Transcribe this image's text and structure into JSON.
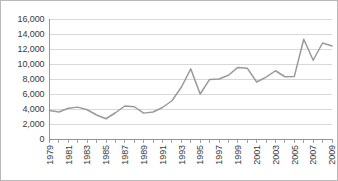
{
  "chart_data": {
    "type": "line",
    "title": "",
    "subtitle": "",
    "xlabel": "",
    "ylabel": "",
    "x": [
      1979,
      1980,
      1981,
      1982,
      1983,
      1984,
      1985,
      1986,
      1987,
      1988,
      1989,
      1990,
      1991,
      1992,
      1993,
      1994,
      1995,
      1996,
      1997,
      1998,
      1999,
      2000,
      2001,
      2002,
      2003,
      2004,
      2005,
      2006,
      2007,
      2008,
      2009
    ],
    "values": [
      3800,
      3600,
      4100,
      4250,
      3900,
      3200,
      2700,
      3500,
      4400,
      4300,
      3450,
      3600,
      4200,
      5100,
      6900,
      9350,
      6000,
      7950,
      8000,
      8500,
      9550,
      9450,
      7600,
      8250,
      9100,
      8300,
      8350,
      13300,
      10500,
      12800,
      12400
    ],
    "series": [
      {
        "name": "series-1",
        "color": "#9a9a9a",
        "values": [
          3800,
          3600,
          4100,
          4250,
          3900,
          3200,
          2700,
          3500,
          4400,
          4300,
          3450,
          3600,
          4200,
          5100,
          6900,
          9350,
          6000,
          7950,
          8000,
          8500,
          9550,
          9450,
          7600,
          8250,
          9100,
          8300,
          8350,
          13300,
          10500,
          12800,
          12400
        ]
      }
    ],
    "ylim": [
      0,
      16000
    ],
    "ytick_values": [
      0,
      2000,
      4000,
      6000,
      8000,
      10000,
      12000,
      14000,
      16000
    ],
    "ytick_labels": [
      "0",
      "2,000",
      "4,000",
      "6,000",
      "8,000",
      "10,000",
      "12,000",
      "14,000",
      "16,000"
    ],
    "xlim": [
      1979,
      2009
    ],
    "xtick_values": [
      1979,
      1980,
      1981,
      1982,
      1983,
      1984,
      1985,
      1986,
      1987,
      1988,
      1989,
      1990,
      1991,
      1992,
      1993,
      1994,
      1995,
      1996,
      1997,
      1998,
      1999,
      2000,
      2001,
      2002,
      2003,
      2004,
      2005,
      2006,
      2007,
      2008,
      2009
    ],
    "xtick_labels": [
      "1979",
      "",
      "1981",
      "",
      "1983",
      "",
      "1985",
      "",
      "1987",
      "",
      "1989",
      "",
      "1991",
      "",
      "1993",
      "",
      "1995",
      "",
      "1997",
      "",
      "1999",
      "",
      "2001",
      "",
      "2003",
      "",
      "2005",
      "",
      "2007",
      "",
      "2009"
    ],
    "xtick_label_rotation": -90,
    "grid": "horizontal",
    "legend": "none",
    "annotations": [],
    "colors": {
      "line": "#9a9a9a",
      "gridline": "#c8c8c8",
      "axis": "#8d8d8d",
      "text": "#3a3a3a",
      "background": "#ffffff",
      "border": "#b9b9b9"
    }
  }
}
